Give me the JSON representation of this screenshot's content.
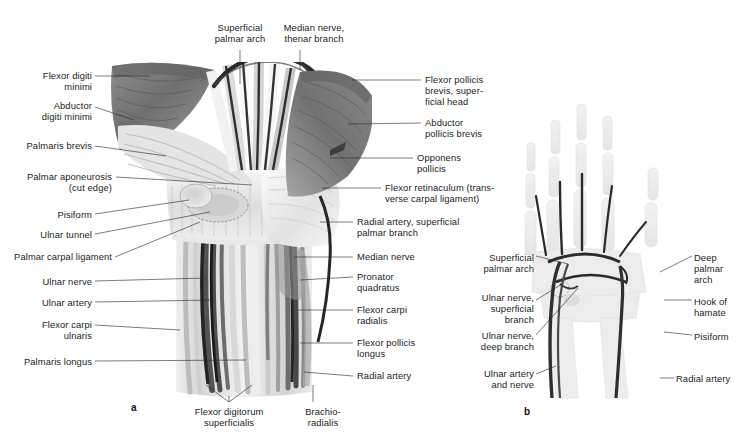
{
  "figure": {
    "background": "#ffffff",
    "text_color": "#1c1c1c",
    "leader_color": "#2b2b2b"
  },
  "panels": [
    {
      "id": "a",
      "caption": "a",
      "x": 131,
      "y": 402
    },
    {
      "id": "b",
      "caption": "b",
      "x": 524,
      "y": 406
    }
  ],
  "panel_a": {
    "title_labels_top": [
      {
        "name": "superficial-palmar-arch",
        "text": "Superficial\npalmar arch",
        "x": 200,
        "y": 22,
        "w": 80,
        "align": "c"
      },
      {
        "name": "median-nerve-thenar-branch",
        "text": "Median nerve,\nthenar branch",
        "x": 271,
        "y": 22,
        "w": 86,
        "align": "c"
      }
    ],
    "labels_left": [
      {
        "name": "flexor-digiti-minimi",
        "text": "Flexor digiti\nminimi",
        "x": 16,
        "y": 70,
        "w": 76,
        "align": "r"
      },
      {
        "name": "abductor-digiti-minimi",
        "text": "Abductor\ndigiti minimi",
        "x": 16,
        "y": 100,
        "w": 76,
        "align": "r"
      },
      {
        "name": "palmaris-brevis",
        "text": "Palmaris brevis",
        "x": 10,
        "y": 140,
        "w": 82,
        "align": "r"
      },
      {
        "name": "palmar-aponeurosis",
        "text": "Palmar aponeurosis\n(cut edge)",
        "x": 0,
        "y": 171,
        "w": 112,
        "align": "r"
      },
      {
        "name": "pisiform",
        "text": "Pisiform",
        "x": 30,
        "y": 209,
        "w": 62,
        "align": "r"
      },
      {
        "name": "ulnar-tunnel",
        "text": "Ulnar tunnel",
        "x": 20,
        "y": 229,
        "w": 72,
        "align": "r"
      },
      {
        "name": "palmar-carpal-ligament",
        "text": "Palmar carpal ligament",
        "x": -2,
        "y": 251,
        "w": 114,
        "align": "r"
      },
      {
        "name": "ulnar-nerve",
        "text": "Ulnar nerve",
        "x": 24,
        "y": 276,
        "w": 68,
        "align": "r"
      },
      {
        "name": "ulnar-artery",
        "text": "Ulnar artery",
        "x": 22,
        "y": 297,
        "w": 70,
        "align": "r"
      },
      {
        "name": "flexor-carpi-ulnaris",
        "text": "Flexor carpi\nulnaris",
        "x": 24,
        "y": 319,
        "w": 68,
        "align": "r"
      },
      {
        "name": "palmaris-longus",
        "text": "Palmaris longus",
        "x": 10,
        "y": 356,
        "w": 82,
        "align": "r"
      }
    ],
    "labels_right": [
      {
        "name": "flexor-pollicis-brevis-superficial-head",
        "text": "Flexor pollicis\nbrevis, super-\nficial head",
        "x": 425,
        "y": 74,
        "w": 98,
        "align": "l"
      },
      {
        "name": "abductor-pollicis-brevis",
        "text": "Abductor\npollicis brevis",
        "x": 425,
        "y": 117,
        "w": 98,
        "align": "l"
      },
      {
        "name": "opponens-pollicis",
        "text": "Opponens\npollicis",
        "x": 417,
        "y": 152,
        "w": 90,
        "align": "l"
      },
      {
        "name": "flexor-retinaculum",
        "text": "Flexor retinaculum (trans-\nverse carpal ligament)",
        "x": 385,
        "y": 182,
        "w": 150,
        "align": "l"
      },
      {
        "name": "radial-artery-superficial-palmar-branch",
        "text": "Radial artery, superficial\npalmar branch",
        "x": 357,
        "y": 216,
        "w": 150,
        "align": "l"
      },
      {
        "name": "median-nerve",
        "text": "Median nerve",
        "x": 357,
        "y": 251,
        "w": 90,
        "align": "l"
      },
      {
        "name": "pronator-quadratus",
        "text": "Pronator\nquadratus",
        "x": 357,
        "y": 271,
        "w": 90,
        "align": "l"
      },
      {
        "name": "flexor-carpi-radialis",
        "text": "Flexor carpi\nradialis",
        "x": 357,
        "y": 304,
        "w": 90,
        "align": "l"
      },
      {
        "name": "flexor-pollicis-longus",
        "text": "Flexor pollicis\nlongus",
        "x": 357,
        "y": 337,
        "w": 90,
        "align": "l"
      },
      {
        "name": "radial-artery",
        "text": "Radial artery",
        "x": 357,
        "y": 370,
        "w": 90,
        "align": "l"
      }
    ],
    "labels_bottom": [
      {
        "name": "flexor-digitorum-superficialis",
        "text": "Flexor digitorum\nsuperficialis",
        "x": 178,
        "y": 406,
        "w": 102,
        "align": "c"
      },
      {
        "name": "brachioradialis",
        "text": "Brachio-\nradialis",
        "x": 292,
        "y": 406,
        "w": 62,
        "align": "c"
      }
    ]
  },
  "panel_b": {
    "labels_left": [
      {
        "name": "superficial-palmar-arch-b",
        "text": "Superficial\npalmar arch",
        "x": 470,
        "y": 252,
        "w": 64,
        "align": "r"
      },
      {
        "name": "ulnar-nerve-superficial-branch",
        "text": "Ulnar nerve,\nsuperficial\nbranch",
        "x": 470,
        "y": 292,
        "w": 64,
        "align": "r"
      },
      {
        "name": "ulnar-nerve-deep-branch",
        "text": "Ulnar nerve,\ndeep branch",
        "x": 470,
        "y": 330,
        "w": 64,
        "align": "r"
      },
      {
        "name": "ulnar-artery-and-nerve",
        "text": "Ulnar artery\nand nerve",
        "x": 470,
        "y": 368,
        "w": 64,
        "align": "r"
      }
    ],
    "labels_right": [
      {
        "name": "deep-palmar-arch",
        "text": "Deep\npalmar\narch",
        "x": 694,
        "y": 252,
        "w": 58,
        "align": "l"
      },
      {
        "name": "hook-of-hamate",
        "text": "Hook of\nhamate",
        "x": 694,
        "y": 296,
        "w": 58,
        "align": "l"
      },
      {
        "name": "pisiform-b",
        "text": "Pisiform",
        "x": 694,
        "y": 331,
        "w": 58,
        "align": "l"
      },
      {
        "name": "radial-artery-b",
        "text": "Radial artery",
        "x": 676,
        "y": 373,
        "w": 78,
        "align": "l"
      }
    ]
  }
}
